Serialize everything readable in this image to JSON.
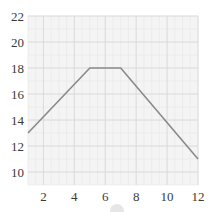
{
  "chart_data": {
    "type": "line",
    "title": "",
    "xlabel": "",
    "ylabel": "",
    "x": [
      1,
      5,
      7,
      12
    ],
    "series": [
      {
        "name": "series-1",
        "values": [
          13,
          18,
          18,
          11
        ],
        "color": "#8a8a8a"
      }
    ],
    "xlim": [
      1,
      12
    ],
    "ylim": [
      9,
      22
    ],
    "x_ticks": [
      2,
      4,
      6,
      8,
      10,
      12
    ],
    "y_ticks": [
      10,
      12,
      14,
      16,
      18,
      20,
      22
    ],
    "x_tick_labels": [
      "2",
      "4",
      "6",
      "8",
      "10",
      "12"
    ],
    "y_tick_labels": [
      "10",
      "12",
      "14",
      "16",
      "18",
      "20",
      "22"
    ],
    "grid": true,
    "minor_grid": true,
    "legend": "none",
    "colors": {
      "plot_background": "#f4f4f4",
      "major_grid": "#dadada",
      "minor_grid": "#e8e8e8",
      "line": "#8a8a8a",
      "tick_text": "#3a3a3a"
    }
  }
}
